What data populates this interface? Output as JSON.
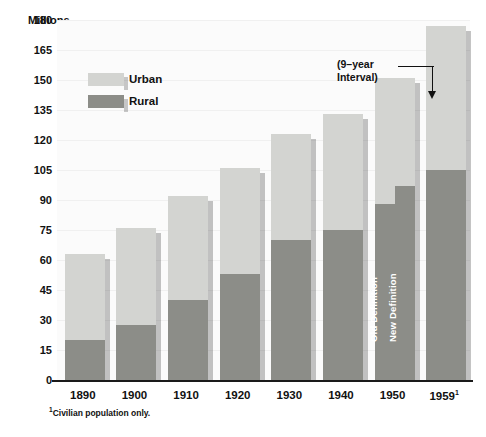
{
  "chart_data": {
    "type": "bar",
    "title": "",
    "ylabel": "Millions",
    "xlabel": "",
    "ylim": [
      0,
      180
    ],
    "yticks": [
      0,
      15,
      30,
      45,
      60,
      75,
      90,
      105,
      120,
      135,
      150,
      165,
      180
    ],
    "grid": true,
    "legend_position": "inside-upper-left",
    "stacked": true,
    "categories": [
      "1890",
      "1900",
      "1910",
      "1920",
      "1930",
      "1940",
      "1950",
      "1959"
    ],
    "series": [
      {
        "name": "Rural",
        "values": [
          20,
          27.5,
          40,
          53,
          70,
          75,
          88,
          105
        ]
      },
      {
        "name": "Urban",
        "values": [
          43,
          48.5,
          52,
          53,
          53,
          58,
          63,
          72
        ]
      }
    ],
    "totals": [
      63,
      76,
      92,
      106,
      123,
      133,
      151,
      177
    ],
    "annotations": [
      {
        "text": "(9–year Interval)",
        "target": "1959"
      },
      {
        "text": "Old Definition",
        "value": 88,
        "category": "1950"
      },
      {
        "text": "New Definition",
        "value": 97,
        "category": "1950"
      }
    ],
    "special_bar": {
      "category": "1950",
      "rural_old_definition": 88,
      "rural_new_definition": 97
    }
  },
  "axis": {
    "y_title": "Millions",
    "y_ticks": [
      "180",
      "165",
      "150",
      "135",
      "120",
      "105",
      "90",
      "75",
      "60",
      "45",
      "30",
      "15",
      "0"
    ],
    "x_ticks": [
      {
        "label": "1890",
        "sup": ""
      },
      {
        "label": "1900",
        "sup": ""
      },
      {
        "label": "1910",
        "sup": ""
      },
      {
        "label": "1920",
        "sup": ""
      },
      {
        "label": "1930",
        "sup": ""
      },
      {
        "label": "1940",
        "sup": ""
      },
      {
        "label": "1950",
        "sup": ""
      },
      {
        "label": "1959",
        "sup": "1"
      }
    ]
  },
  "legend": {
    "items": [
      {
        "label": "Urban",
        "color": "#d3d4d1"
      },
      {
        "label": "Rural",
        "color": "#8c8d88"
      }
    ]
  },
  "annotation": {
    "line1": "(9–year",
    "line2": "Interval)"
  },
  "bar_labels": {
    "old_definition": "Old Definition",
    "new_definition": "New Definition"
  },
  "footnote": {
    "marker": "1",
    "text": "Civilian population only."
  },
  "colors": {
    "urban": "#d3d4d1",
    "rural": "#8c8d88",
    "axis": "#1a1a1a",
    "grid": "#f0f0f0",
    "text": "#111111",
    "plot_bg": "#fbfbfb"
  }
}
